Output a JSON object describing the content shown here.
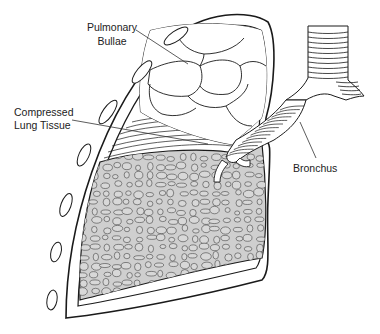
{
  "figure": {
    "labels": {
      "bullae_line1": "Pulmonary",
      "bullae_line2": "Bullae",
      "compressed_line1": "Compressed",
      "compressed_line2": "Lung Tissue",
      "bronchus": "Bronchus"
    },
    "colors": {
      "line": "#1a1a1a",
      "lung_tissue_fill": "#cfcfcf",
      "background": "#ffffff"
    }
  }
}
